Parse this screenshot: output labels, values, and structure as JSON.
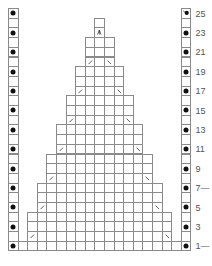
{
  "chart": {
    "type": "knitting-chart",
    "columns": 19,
    "rows": 25,
    "origin": {
      "x": 8,
      "y": 8
    },
    "cell_width": 9.6,
    "cell_height": 9.7,
    "line_color": "#8a8a8a",
    "dot_color": "#111111",
    "edge_columns": {
      "left": {
        "col": 0,
        "dot_rows": [
          1,
          3,
          5,
          7,
          9,
          11,
          13,
          15,
          17,
          19,
          21,
          23,
          25
        ]
      },
      "right": {
        "col": 18,
        "dot_rows": [
          1,
          3,
          5,
          7,
          9,
          11,
          13,
          15,
          17,
          19,
          21,
          23
        ],
        "special_rows": {
          "25": "dot-slash"
        }
      }
    },
    "bands": [
      {
        "rows": [
          1,
          1
        ],
        "cols": [
          1,
          17
        ]
      },
      {
        "rows": [
          2,
          4
        ],
        "cols": [
          2,
          16
        ],
        "decrease_row": 2
      },
      {
        "rows": [
          5,
          7
        ],
        "cols": [
          3,
          15
        ],
        "decrease_row": 5
      },
      {
        "rows": [
          8,
          10
        ],
        "cols": [
          4,
          14
        ],
        "decrease_row": 8
      },
      {
        "rows": [
          11,
          13
        ],
        "cols": [
          5,
          13
        ],
        "decrease_row": 11
      },
      {
        "rows": [
          14,
          16
        ],
        "cols": [
          6,
          12
        ],
        "decrease_row": 14
      },
      {
        "rows": [
          17,
          19
        ],
        "cols": [
          7,
          11
        ],
        "decrease_row": 17
      },
      {
        "rows": [
          20,
          22
        ],
        "cols": [
          8,
          10
        ],
        "decrease_row": 20
      },
      {
        "rows": [
          23,
          23
        ],
        "cols": [
          9,
          9
        ],
        "center_double_decrease_row": 23
      },
      {
        "rows": [
          24,
          24
        ],
        "cols": [
          9,
          9
        ]
      }
    ],
    "symbols": {
      "left_decrease": "/",
      "right_decrease": "\\",
      "center_double_decrease": "^",
      "purl": "•"
    },
    "row_labels": [
      {
        "row": 1,
        "text": "1",
        "marker": "—"
      },
      {
        "row": 3,
        "text": "3",
        "marker": ""
      },
      {
        "row": 5,
        "text": "5",
        "marker": ""
      },
      {
        "row": 7,
        "text": "7",
        "marker": "—"
      },
      {
        "row": 9,
        "text": "9",
        "marker": ""
      },
      {
        "row": 11,
        "text": "11",
        "marker": ""
      },
      {
        "row": 13,
        "text": "13",
        "marker": ""
      },
      {
        "row": 15,
        "text": "15",
        "marker": ""
      },
      {
        "row": 17,
        "text": "17",
        "marker": ""
      },
      {
        "row": 19,
        "text": "19",
        "marker": ""
      },
      {
        "row": 21,
        "text": "21",
        "marker": ""
      },
      {
        "row": 23,
        "text": "23",
        "marker": ""
      },
      {
        "row": 25,
        "text": "25",
        "marker": ""
      }
    ]
  }
}
